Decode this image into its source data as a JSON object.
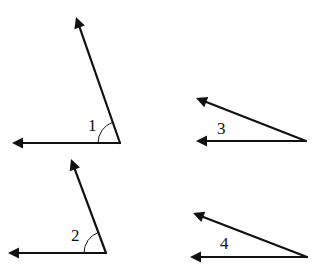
{
  "diagram": {
    "type": "angles",
    "stroke_color": "#111111",
    "background": "#ffffff",
    "angles": [
      {
        "label": "1",
        "vertex": [
          120,
          143
        ],
        "ray_a_end": [
          12,
          143
        ],
        "ray_b_end": [
          76,
          17
        ],
        "label_pos": [
          88,
          131
        ],
        "arc_marked": true,
        "arc_radius": 22
      },
      {
        "label": "2",
        "vertex": [
          106,
          253
        ],
        "ray_a_end": [
          8,
          253
        ],
        "ray_b_end": [
          71,
          159
        ],
        "label_pos": [
          71,
          241
        ],
        "arc_marked": true,
        "arc_radius": 22
      },
      {
        "label": "3",
        "vertex": [
          306,
          141
        ],
        "ray_a_end": [
          196,
          141
        ],
        "ray_b_end": [
          196,
          98
        ],
        "label_pos": [
          217,
          134
        ],
        "arc_marked": false
      },
      {
        "label": "4",
        "vertex": [
          307,
          257
        ],
        "ray_a_end": [
          190,
          257
        ],
        "ray_b_end": [
          193,
          213
        ],
        "label_pos": [
          220,
          249
        ],
        "arc_marked": false
      }
    ]
  }
}
